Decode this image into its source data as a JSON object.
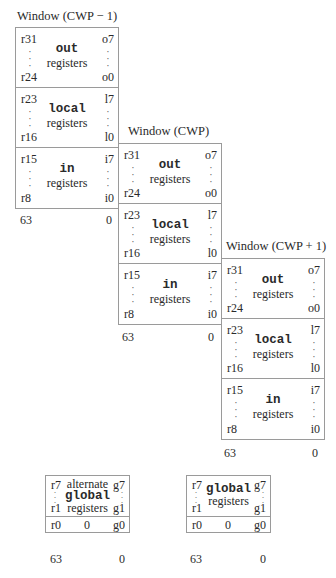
{
  "windows": [
    {
      "title": "Window (CWP − 1)",
      "rows": [
        {
          "kw": "out",
          "sub": "registers",
          "tl": "r31",
          "tr": "o7",
          "bl": "r24",
          "br": "o0"
        },
        {
          "kw": "local",
          "sub": "registers",
          "tl": "r23",
          "tr": "l7",
          "bl": "r16",
          "br": "l0"
        },
        {
          "kw": "in",
          "sub": "registers",
          "tl": "r15",
          "tr": "i7",
          "bl": "r8",
          "br": "i0"
        }
      ],
      "bits_high": "63",
      "bits_low": "0"
    },
    {
      "title": "Window (CWP)",
      "rows": [
        {
          "kw": "out",
          "sub": "registers",
          "tl": "r31",
          "tr": "o7",
          "bl": "r24",
          "br": "o0"
        },
        {
          "kw": "local",
          "sub": "registers",
          "tl": "r23",
          "tr": "l7",
          "bl": "r16",
          "br": "l0"
        },
        {
          "kw": "in",
          "sub": "registers",
          "tl": "r15",
          "tr": "i7",
          "bl": "r8",
          "br": "i0"
        }
      ],
      "bits_high": "63",
      "bits_low": "0"
    },
    {
      "title": "Window (CWP + 1)",
      "rows": [
        {
          "kw": "out",
          "sub": "registers",
          "tl": "r31",
          "tr": "o7",
          "bl": "r24",
          "br": "o0"
        },
        {
          "kw": "local",
          "sub": "registers",
          "tl": "r23",
          "tr": "l7",
          "bl": "r16",
          "br": "l0"
        },
        {
          "kw": "in",
          "sub": "registers",
          "tl": "r15",
          "tr": "i7",
          "bl": "r8",
          "br": "i0"
        }
      ],
      "bits_high": "63",
      "bits_low": "0"
    }
  ],
  "globals": [
    {
      "pre": "alternate",
      "kw": "global",
      "sub": "registers",
      "tl": "r7",
      "tr": "g7",
      "bl": "r1",
      "br": "g1",
      "r0": "r0",
      "zero": "0",
      "g0": "g0",
      "bits_high": "63",
      "bits_low": "0"
    },
    {
      "pre": "",
      "kw": "global",
      "sub": "registers",
      "tl": "r7",
      "tr": "g7",
      "bl": "r1",
      "br": "g1",
      "r0": "r0",
      "zero": "0",
      "g0": "g0",
      "bits_high": "63",
      "bits_low": "0"
    }
  ],
  "dots": ":\n:\n:"
}
